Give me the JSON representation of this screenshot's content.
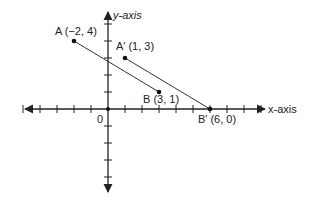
{
  "diagram": {
    "type": "coordinate-plane",
    "origin_label": "0",
    "x_axis_label": "x-axis",
    "y_axis_label": "y-axis",
    "x_ticks": [
      -5,
      -4,
      -3,
      -2,
      -1,
      1,
      2,
      3,
      4,
      5,
      6,
      7,
      8,
      9
    ],
    "y_ticks": [
      -4,
      -3,
      -2,
      -1,
      1,
      2,
      3,
      4,
      5
    ],
    "points": [
      {
        "name": "A",
        "label": "A (−2, 4)",
        "x": -2,
        "y": 4
      },
      {
        "name": "B",
        "label": "B (3, 1)",
        "x": 3,
        "y": 1
      },
      {
        "name": "A'",
        "label": "A′ (1, 3)",
        "x": 1,
        "y": 3
      },
      {
        "name": "B'",
        "label": "B′ (6, 0)",
        "x": 6,
        "y": 0
      }
    ],
    "segments": [
      {
        "from": "A",
        "to": "B"
      },
      {
        "from": "A'",
        "to": "B'"
      }
    ],
    "colors": {
      "line": "#333333",
      "axis": "#222222",
      "text": "#222222"
    }
  },
  "labels": {
    "A": "A (−2, 4)",
    "B": "B (3, 1)",
    "A_prime": "A′ (1, 3)",
    "B_prime": "B′ (6, 0)",
    "origin": "0",
    "x_axis": "x-axis",
    "y_axis": "y-axis"
  }
}
